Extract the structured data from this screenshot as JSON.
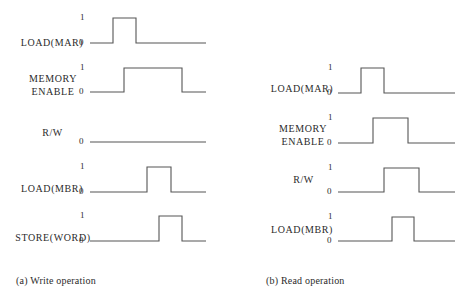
{
  "panels": [
    {
      "id": "write",
      "caption": "(a) Write operation",
      "caption_pos": [
        16,
        275
      ],
      "signals": [
        {
          "label": "LOAD(MAR)",
          "label_pos": [
            14,
            36
          ],
          "label_w": 76,
          "show_high": true,
          "hi_y": 18,
          "lo_y": 43,
          "x0": 90,
          "x1": 206,
          "rise": 113,
          "fall": 136,
          "one_label": "1",
          "zero_label": "0"
        },
        {
          "label": "MEMORY\nENABLE",
          "label_pos": [
            18,
            72
          ],
          "label_w": 70,
          "show_high": true,
          "hi_y": 68,
          "lo_y": 92,
          "x0": 90,
          "x1": 206,
          "rise": 124,
          "fall": 182,
          "one_label": "1",
          "zero_label": "0"
        },
        {
          "label": "R/W",
          "label_pos": [
            30,
            126
          ],
          "label_w": 45,
          "show_high": false,
          "hi_y": 142,
          "lo_y": 142,
          "x0": 90,
          "x1": 206,
          "rise": null,
          "fall": null,
          "one_label": "",
          "zero_label": "0"
        },
        {
          "label": "LOAD(MBR)",
          "label_pos": [
            14,
            182
          ],
          "label_w": 76,
          "show_high": true,
          "hi_y": 167,
          "lo_y": 192,
          "x0": 90,
          "x1": 206,
          "rise": 147,
          "fall": 171,
          "one_label": "1",
          "zero_label": "0"
        },
        {
          "label": "STORE(WORD)",
          "label_pos": [
            12,
            231
          ],
          "label_w": 82,
          "show_high": true,
          "hi_y": 216,
          "lo_y": 241,
          "x0": 90,
          "x1": 206,
          "rise": 159,
          "fall": 182,
          "one_label": "1",
          "zero_label": "0"
        }
      ]
    },
    {
      "id": "read",
      "caption": "(b) Read operation",
      "caption_pos": [
        266,
        275
      ],
      "signals": [
        {
          "label": "LOAD(MAR)",
          "label_pos": [
            264,
            82
          ],
          "label_w": 76,
          "show_high": true,
          "hi_y": 68,
          "lo_y": 93,
          "x0": 338,
          "x1": 455,
          "rise": 361,
          "fall": 384,
          "one_label": "1",
          "zero_label": "0"
        },
        {
          "label": "MEMORY\nENABLE",
          "label_pos": [
            267,
            122
          ],
          "label_w": 72,
          "show_high": true,
          "hi_y": 118,
          "lo_y": 143,
          "x0": 338,
          "x1": 455,
          "rise": 373,
          "fall": 408,
          "one_label": "1",
          "zero_label": "0"
        },
        {
          "label": "R/W",
          "label_pos": [
            281,
            173
          ],
          "label_w": 45,
          "show_high": true,
          "hi_y": 168,
          "lo_y": 192,
          "x0": 338,
          "x1": 455,
          "rise": 384,
          "fall": 419,
          "one_label": "1",
          "zero_label": "0"
        },
        {
          "label": "LOAD(MBR)",
          "label_pos": [
            264,
            223
          ],
          "label_w": 76,
          "show_high": true,
          "hi_y": 217,
          "lo_y": 241,
          "x0": 338,
          "x1": 455,
          "rise": 392,
          "fall": 414,
          "one_label": "1",
          "zero_label": "0"
        }
      ]
    }
  ]
}
